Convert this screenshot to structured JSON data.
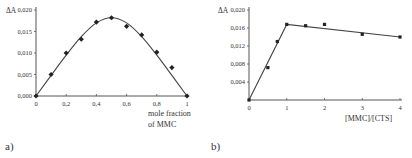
{
  "chart_data": [
    {
      "panel": "a)",
      "type": "scatter",
      "title": "",
      "xlabel": "mole fraction of MMC",
      "xlabel_lines": [
        "mole fraction",
        "of MMC"
      ],
      "ylabel": "ΔA",
      "xlim": [
        0,
        1
      ],
      "ylim": [
        0,
        0.02
      ],
      "xticks": [
        "0",
        "0,2",
        "0,4",
        "0,6",
        "0,8",
        "1"
      ],
      "yticks": [
        "0,000",
        "0,005",
        "0,010",
        "0,015",
        "0,020"
      ],
      "grid": false,
      "legend": null,
      "series": [
        {
          "name": "measured",
          "x": [
            0,
            0.1,
            0.2,
            0.3,
            0.4,
            0.5,
            0.6,
            0.7,
            0.8,
            0.9,
            1.0
          ],
          "y": [
            0.0,
            0.005,
            0.01,
            0.0132,
            0.0172,
            0.0182,
            0.0162,
            0.0142,
            0.0102,
            0.0066,
            0.0
          ]
        },
        {
          "name": "fit curve",
          "style": "smooth line",
          "x": [
            0,
            0.1,
            0.2,
            0.3,
            0.4,
            0.5,
            0.6,
            0.7,
            0.8,
            0.9,
            1.0
          ],
          "y": [
            0.0,
            0.0048,
            0.0095,
            0.0138,
            0.017,
            0.0182,
            0.017,
            0.0138,
            0.0095,
            0.0048,
            0.0
          ]
        }
      ]
    },
    {
      "panel": "b)",
      "type": "line",
      "title": "",
      "xlabel": "[MMC]/[CTS]",
      "ylabel": "ΔA",
      "xlim": [
        0,
        4
      ],
      "ylim": [
        0,
        0.02
      ],
      "xticks": [
        "0",
        "1",
        "2",
        "3",
        "4"
      ],
      "yticks": [
        "0,004",
        "0,008",
        "0,012",
        "0,016",
        "0,020"
      ],
      "grid": false,
      "legend": null,
      "series": [
        {
          "name": "measured",
          "x": [
            0,
            0.5,
            0.75,
            1,
            1.5,
            2,
            3,
            4
          ],
          "y": [
            0.0,
            0.0072,
            0.013,
            0.0168,
            0.0165,
            0.0168,
            0.0146,
            0.014
          ]
        },
        {
          "name": "fit lines",
          "style": "two straight segments",
          "x": [
            0,
            1,
            4
          ],
          "y": [
            0.0,
            0.0168,
            0.014
          ]
        }
      ]
    }
  ],
  "panels": {
    "a": {
      "label": "a)",
      "ylabel": "ΔA",
      "xlabel_line1": "mole fraction",
      "xlabel_line2": "of MMC"
    },
    "b": {
      "label": "b)",
      "ylabel": "ΔA",
      "xlabel": "[MMC]/[CTS]"
    }
  }
}
